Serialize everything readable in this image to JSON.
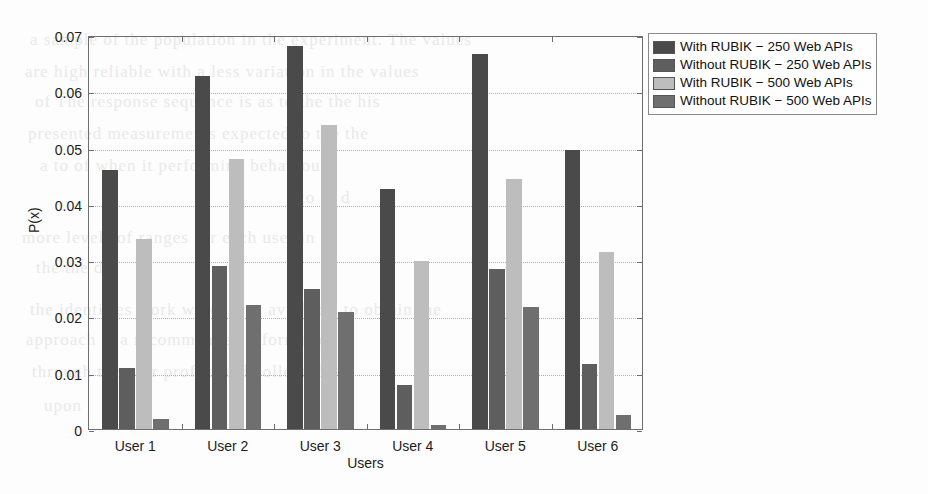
{
  "figure": {
    "background_color": "#fdfdfd",
    "axis_color": "#6e6e6e",
    "grid_color": "#b0b0b0"
  },
  "bleed_text": [
    "a sample of the population in the experiment. The values",
    "are high reliable with a less variation in the values",
    "of  The response sequence is as to the  the his",
    "presented measurements expected to  the  the",
    "a to  of  when  it  performing behaviour",
    "to to  d",
    "more levels  of  ranges  for  each  user  in",
    "the  the  d",
    "the identifies work which was available to obtain the",
    "approach is a recommended information",
    "through the user profile and collected",
    "upon"
  ],
  "legend": {
    "position": "right",
    "entries": [
      {
        "label": "With RUBIK − 250 Web APIs",
        "color": "#4a4a4a"
      },
      {
        "label": "Without RUBIK − 250 Web APIs",
        "color": "#5e5e5e"
      },
      {
        "label": "With RUBIK − 500 Web APIs",
        "color": "#bdbdbd"
      },
      {
        "label": "Without RUBIK − 500 Web APIs",
        "color": "#6f6f6f"
      }
    ]
  },
  "chart_data": {
    "type": "bar",
    "title": "",
    "xlabel": "Users",
    "ylabel": "P(x)",
    "categories": [
      "User 1",
      "User 2",
      "User 3",
      "User 4",
      "User 5",
      "User 6"
    ],
    "ylim": [
      0,
      0.07
    ],
    "yticks": [
      0,
      0.01,
      0.02,
      0.03,
      0.04,
      0.05,
      0.06,
      0.07
    ],
    "ytick_labels": [
      "0",
      "0.01",
      "0.02",
      "0.03",
      "0.04",
      "0.05",
      "0.06",
      "0.07"
    ],
    "grid": true,
    "legend_position": "right",
    "series": [
      {
        "name": "With RUBIK − 250 Web APIs",
        "color": "#4a4a4a",
        "values": [
          0.046,
          0.0627,
          0.068,
          0.0427,
          0.0667,
          0.0495
        ]
      },
      {
        "name": "Without RUBIK − 250 Web APIs",
        "color": "#5e5e5e",
        "values": [
          0.0108,
          0.029,
          0.0248,
          0.0079,
          0.0285,
          0.0115
        ]
      },
      {
        "name": "With RUBIK − 500 Web APIs",
        "color": "#bdbdbd",
        "values": [
          0.0338,
          0.048,
          0.054,
          0.0298,
          0.0445,
          0.0315
        ]
      },
      {
        "name": "Without RUBIK − 500 Web APIs",
        "color": "#6f6f6f",
        "values": [
          0.0018,
          0.022,
          0.0208,
          0.0008,
          0.0217,
          0.0025
        ]
      }
    ]
  }
}
